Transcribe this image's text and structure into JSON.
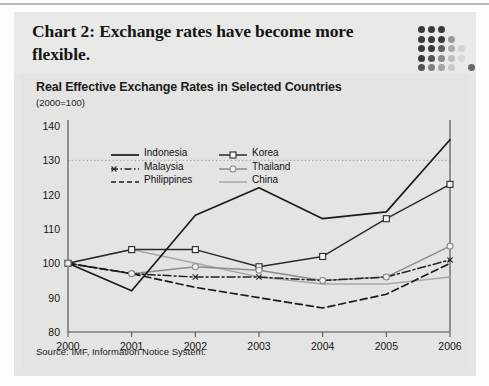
{
  "figure": {
    "title": "Chart 2: Exchange rates have become more flexible.",
    "decoration": "dot-matrix"
  },
  "chart_data": {
    "type": "line",
    "title": "Real Effective Exchange Rates in Selected Countries",
    "subtitle": "(2000=100)",
    "source": "Source: IMF, Information Notice System.",
    "xlabel": "",
    "ylabel": "",
    "x": [
      "2000",
      "2001",
      "2002",
      "2003",
      "2004",
      "2005",
      "2006"
    ],
    "categories": [
      "2000",
      "2001",
      "2002",
      "2003",
      "2004",
      "2005",
      "2006"
    ],
    "ylim": [
      80,
      140
    ],
    "yticks": [
      80,
      90,
      100,
      110,
      120,
      130,
      140
    ],
    "ytick_labels": [
      "80",
      "90",
      "100",
      "110",
      "120",
      "130",
      "140"
    ],
    "grid": "dotted gridline at 130 only",
    "legend_position": "upper-left inside plot",
    "series": [
      {
        "name": "Indonesia",
        "style": "solid",
        "marker": "none",
        "color": "#1b1b1b",
        "values": [
          100,
          92,
          114,
          122,
          113,
          115,
          136
        ]
      },
      {
        "name": "Malaysia",
        "style": "dash-dot",
        "marker": "x",
        "color": "#232323",
        "values": [
          100,
          97,
          96,
          96,
          95,
          96,
          101
        ]
      },
      {
        "name": "Philippines",
        "style": "dashed",
        "marker": "none",
        "color": "#1b1b1b",
        "values": [
          100,
          97,
          93,
          90,
          87,
          91,
          100
        ]
      },
      {
        "name": "Korea",
        "style": "solid",
        "marker": "square-open",
        "color": "#2b2b2b",
        "values": [
          100,
          104,
          104,
          99,
          102,
          113,
          123
        ]
      },
      {
        "name": "Thailand",
        "style": "solid",
        "marker": "circle-open",
        "color": "#8c8c8c",
        "values": [
          100,
          97,
          99,
          98,
          95,
          96,
          105
        ]
      },
      {
        "name": "China",
        "style": "solid",
        "marker": "none",
        "color": "#a8a8a8",
        "values": [
          100,
          104,
          100,
          96,
          94,
          94,
          96
        ]
      }
    ]
  }
}
